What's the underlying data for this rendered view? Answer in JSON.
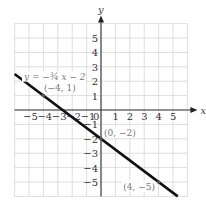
{
  "chart_data": {
    "type": "line",
    "title": "",
    "xlabel": "x",
    "ylabel": "y",
    "xlim": [
      -6,
      6
    ],
    "ylim": [
      -6,
      6
    ],
    "grid": true,
    "x_ticks": [
      -5,
      -4,
      -3,
      -2,
      -1,
      0,
      1,
      2,
      3,
      4,
      5
    ],
    "y_ticks": [
      -5,
      -4,
      -3,
      -2,
      -1,
      1,
      2,
      3,
      4,
      5
    ],
    "series": [
      {
        "name": "y = -3/4 x - 2",
        "equation": "y = -¾ x − 2",
        "slope": -0.75,
        "intercept": -2,
        "x": [
          -6,
          5.33
        ],
        "y": [
          2.5,
          -6
        ]
      }
    ],
    "points": [
      {
        "label": "(−4, 1)",
        "x": -4,
        "y": 1
      },
      {
        "label": "(0, −2)",
        "x": 0,
        "y": -2
      },
      {
        "label": "(4, −5)",
        "x": 4,
        "y": -5
      }
    ],
    "annotations": [
      {
        "text": "y = −¾ x − 2",
        "x": -5.5,
        "y": 2.3
      }
    ]
  },
  "labels": {
    "x_axis": "x",
    "y_axis": "y",
    "origin": "0",
    "equation": "y = −¾ x − 2",
    "p1": "(−4, 1)",
    "p2": "(0, −2)",
    "p3": "(4, −5)"
  }
}
